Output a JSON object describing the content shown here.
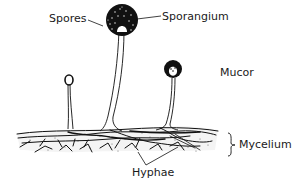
{
  "diagram": {
    "subject": "Mucor",
    "labels": {
      "spores": "Spores",
      "sporangium": "Sporangium",
      "organism": "Mucor",
      "mycelium": "Mycelium",
      "hyphae": "Hyphae"
    },
    "colors": {
      "ink": "#111111",
      "background": "#ffffff",
      "spore_dots": "#ffffff"
    },
    "structures": [
      {
        "name": "sporangium-large",
        "cx": 122,
        "cy": 20,
        "r": 16
      },
      {
        "name": "sporangium-small",
        "cx": 69,
        "cy": 80,
        "r": 4
      },
      {
        "name": "sporangium-medium",
        "cx": 173,
        "cy": 70,
        "r": 9
      }
    ]
  }
}
